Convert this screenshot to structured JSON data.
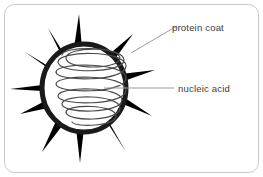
{
  "figure": {
    "background_color": "#ffffff",
    "border": {
      "color": "#c8c8c8",
      "radius": 10,
      "width": 1
    },
    "colors": {
      "capsid_stroke": "#1a1a1a",
      "spike_fill": "#1a1a1a",
      "nucleic_acid_stroke": "#4a4a4a",
      "leader_line": "#9a9a9a",
      "label_text": "#3d3d3d"
    },
    "capsid": {
      "center_x": 84,
      "center_y": 88,
      "radius_x": 42,
      "radius_y": 44,
      "stroke_width": 5,
      "spike_count": 11,
      "spike_angles_deg": [
        -98,
        -68,
        -40,
        -12,
        18,
        48,
        78,
        108,
        140,
        168,
        200
      ]
    },
    "nucleic_acid": {
      "shape": "helix",
      "loops": 5,
      "loop_width": 56,
      "loop_height": 15,
      "top_y": 52,
      "bottom_y": 126
    }
  },
  "labels": [
    {
      "id": "protein-coat",
      "text": "protein coat",
      "text_x": 172,
      "text_y": 31,
      "leader": {
        "x1": 131,
        "y1": 53,
        "x2": 177,
        "y2": 26
      }
    },
    {
      "id": "nucleic-acid",
      "text": "nucleic acid",
      "text_x": 178,
      "text_y": 92,
      "leader": {
        "x1": 104,
        "y1": 88,
        "x2": 174,
        "y2": 88
      }
    }
  ]
}
